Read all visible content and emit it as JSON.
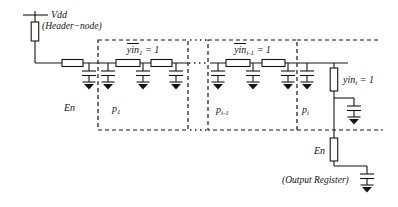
{
  "diagram": {
    "colors": {
      "ink": "#141414",
      "background": "#ffffff"
    },
    "power": {
      "vdd": "Vdd",
      "header_node": "(Header−node)"
    },
    "enable_left": "En",
    "stages": [
      {
        "gate_base": "yin",
        "gate_sub": "1",
        "gate_eq": " = 1",
        "node_base": "p",
        "node_sub": "1"
      },
      {
        "gate_base": "yin",
        "gate_sub": "i-1",
        "gate_eq": " = 1",
        "node_base": "p",
        "node_sub": "i-1"
      },
      {
        "node_base": "p",
        "node_sub": "i"
      }
    ],
    "output_chain": {
      "gate_base": "yin",
      "gate_sub": "i",
      "gate_eq": " = 1",
      "enable": "En",
      "output": "(Output Register)"
    }
  }
}
